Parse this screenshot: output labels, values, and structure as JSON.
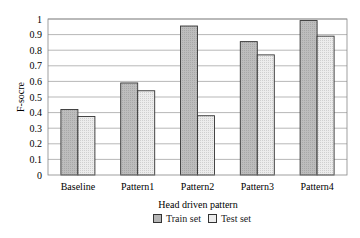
{
  "chart_data": {
    "type": "bar",
    "title": "",
    "xlabel": "Head driven pattern",
    "ylabel": "F-socre",
    "ylim": [
      0,
      1
    ],
    "yticks": [
      "0",
      "0.1",
      "0.2",
      "0.3",
      "0.4",
      "0.5",
      "0.6",
      "0.7",
      "0.8",
      "0.9",
      "1"
    ],
    "grid": true,
    "legend_position": "bottom",
    "categories": [
      "Baseline",
      "Pattern1",
      "Pattern2",
      "Pattern3",
      "Pattern4"
    ],
    "series": [
      {
        "name": "Train set",
        "color": "#b5b5b5",
        "values": [
          0.42,
          0.59,
          0.955,
          0.855,
          0.99
        ]
      },
      {
        "name": "Test set",
        "color": "#e6e6e6",
        "values": [
          0.375,
          0.54,
          0.38,
          0.77,
          0.89
        ]
      }
    ]
  }
}
